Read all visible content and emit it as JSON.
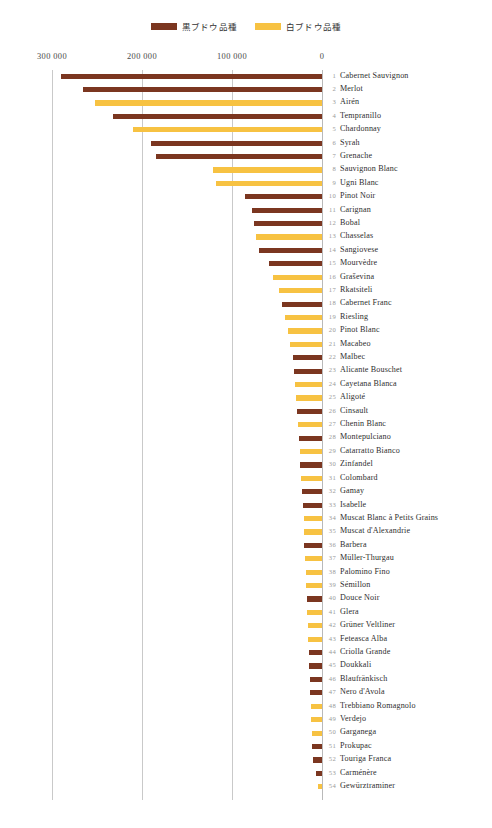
{
  "chart_data": {
    "type": "bar",
    "orientation": "horizontal",
    "direction": "right-to-left",
    "title": "",
    "xlabel": "",
    "ylabel": "",
    "xlim": [
      0,
      300000
    ],
    "axis_ticks": [
      "300 000",
      "200 000",
      "100 000",
      "0"
    ],
    "axis_tick_values": [
      300000,
      200000,
      100000,
      0
    ],
    "grid": true,
    "legend_position": "top-center",
    "colors": {
      "dark": "#7B3620",
      "white": "#F7C242",
      "gridline": "#c9c9c9",
      "text": "#2e2e2e",
      "rank": "#9a9a9a"
    },
    "legend": [
      {
        "label": "黒ブドウ品種",
        "key": "dark",
        "color": "#7B3620"
      },
      {
        "label": "白ブドウ品種",
        "key": "white",
        "color": "#F7C242"
      }
    ],
    "categories": [
      "Cabernet Sauvignon",
      "Merlot",
      "Airén",
      "Tempranillo",
      "Chardonnay",
      "Syrah",
      "Grenache",
      "Sauvignon Blanc",
      "Ugni Blanc",
      "Pinot Noir",
      "Carignan",
      "Bobal",
      "Chasselas",
      "Sangiovese",
      "Mourvèdre",
      "Graševina",
      "Rkatsiteli",
      "Cabernet Franc",
      "Riesling",
      "Pinot Blanc",
      "Macabeo",
      "Malbec",
      "Alicante Bouschet",
      "Cayetana Blanca",
      "Aligoté",
      "Cinsault",
      "Chenin Blanc",
      "Montepulciano",
      "Catarratto Bianco",
      "Zinfandel",
      "Colombard",
      "Gamay",
      "Isabelle",
      "Muscat Blanc à Petits Grains",
      "Muscat d'Alexandrie",
      "Barbera",
      "Müller-Thurgau",
      "Palomino Fino",
      "Sémillon",
      "Douce Noir",
      "Glera",
      "Grüner Veltliner",
      "Feteasca Alba",
      "Criolla Grande",
      "Doukkali",
      "Blaufränkisch",
      "Nero d'Avola",
      "Trebbiano Romagnolo",
      "Verdejo",
      "Garganega",
      "Prokupac",
      "Touriga Franca",
      "Carménère",
      "Gewürztraminer"
    ],
    "values": [
      290000,
      266000,
      252000,
      232000,
      210000,
      190000,
      184000,
      121000,
      118000,
      86000,
      78000,
      76000,
      73000,
      70000,
      59000,
      55000,
      48000,
      45000,
      41000,
      38000,
      36000,
      32000,
      31000,
      30000,
      29000,
      28000,
      27000,
      26000,
      25000,
      24000,
      23000,
      22000,
      21000,
      20500,
      20000,
      19500,
      19000,
      18000,
      17500,
      17000,
      16500,
      16000,
      15500,
      15000,
      14000,
      13500,
      13000,
      12500,
      12000,
      11500,
      11000,
      9500,
      7000,
      5000
    ],
    "series_type": [
      "dark",
      "dark",
      "white",
      "dark",
      "white",
      "dark",
      "dark",
      "white",
      "white",
      "dark",
      "dark",
      "dark",
      "white",
      "dark",
      "dark",
      "white",
      "white",
      "dark",
      "white",
      "white",
      "white",
      "dark",
      "dark",
      "white",
      "white",
      "dark",
      "white",
      "dark",
      "white",
      "dark",
      "white",
      "dark",
      "dark",
      "white",
      "white",
      "dark",
      "white",
      "white",
      "white",
      "dark",
      "white",
      "white",
      "white",
      "dark",
      "dark",
      "dark",
      "dark",
      "white",
      "white",
      "white",
      "dark",
      "dark",
      "dark",
      "white"
    ]
  }
}
